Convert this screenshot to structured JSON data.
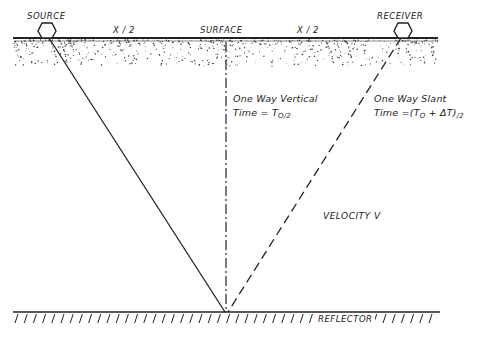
{
  "labels": {
    "source": "SOURCE",
    "receiver": "RECEIVER",
    "surface": "SURFACE",
    "half_offset_left": "X / 2",
    "half_offset_right": "X / 2",
    "vertical_title": "One Way Vertical",
    "vertical_time_prefix": "Time = T",
    "vertical_time_sub": "O/2",
    "slant_title": "One Way Slant",
    "slant_time_prefix": "Time =(T",
    "slant_time_sub0": "O",
    "slant_time_mid": " + ΔT)",
    "slant_time_sub": "/2",
    "velocity": "VELOCITY  V",
    "reflector": "REFLECTOR"
  },
  "colors": {
    "ink": "#222222",
    "background": "#ffffff"
  }
}
